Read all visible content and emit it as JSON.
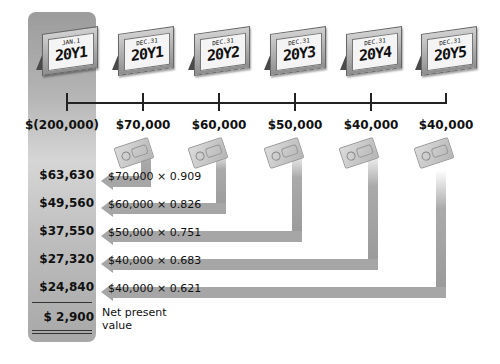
{
  "calendars": [
    {
      "date": "JAN.1",
      "year": "20Y1"
    },
    {
      "date": "DEC.31",
      "year": "20Y1"
    },
    {
      "date": "DEC.31",
      "year": "20Y2"
    },
    {
      "date": "DEC.31",
      "year": "20Y3"
    },
    {
      "date": "DEC.31",
      "year": "20Y4"
    },
    {
      "date": "DEC.31",
      "year": "20Y5"
    }
  ],
  "cash_flows": [
    "$(200,000)",
    "$70,000",
    "$60,000",
    "$50,000",
    "$40,000",
    "$40,000"
  ],
  "present_values": [
    {
      "value": "$63,630",
      "calc": "$70,000 × 0.909"
    },
    {
      "value": "$49,560",
      "calc": "$60,000 × 0.826"
    },
    {
      "value": "$37,550",
      "calc": "$50,000 × 0.751"
    },
    {
      "value": "$27,320",
      "calc": "$40,000 × 0.683"
    },
    {
      "value": "$24,840",
      "calc": "$40,000 × 0.621"
    }
  ],
  "net_present_value": {
    "value": "$ 2,900",
    "label": "Net present value"
  },
  "colors": {
    "column": "#b4b4b4",
    "arrow": "#a6a6a6",
    "line": "#222222"
  }
}
